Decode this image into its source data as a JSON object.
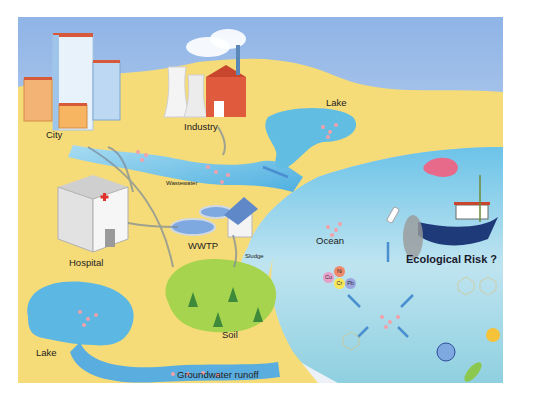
{
  "figure": {
    "labels": {
      "city": "City",
      "industry": "Industry",
      "lake_top": "Lake",
      "wastewater": "Wastewater",
      "wwtp": "WWTP",
      "hospital": "Hospital",
      "sludge": "Sludge",
      "soil": "Soil",
      "ocean": "Ocean",
      "ecological_risk": "Ecological Risk ?",
      "lake_bottom": "Lake",
      "groundwater": "Groundwater runoff"
    },
    "metals": [
      "Cu",
      "Ni",
      "Cr",
      "Pb"
    ],
    "colors": {
      "sky_top": "#8fb4e6",
      "sky_bottom": "#e8eef8",
      "sand": "#f6dc78",
      "water": "#5fb8e3",
      "ocean": "#a9dcec",
      "soil": "#a6d44e",
      "particle": "#f4a0a8",
      "arrow": "#4a8fcf",
      "boat": "#1f3a78"
    }
  }
}
